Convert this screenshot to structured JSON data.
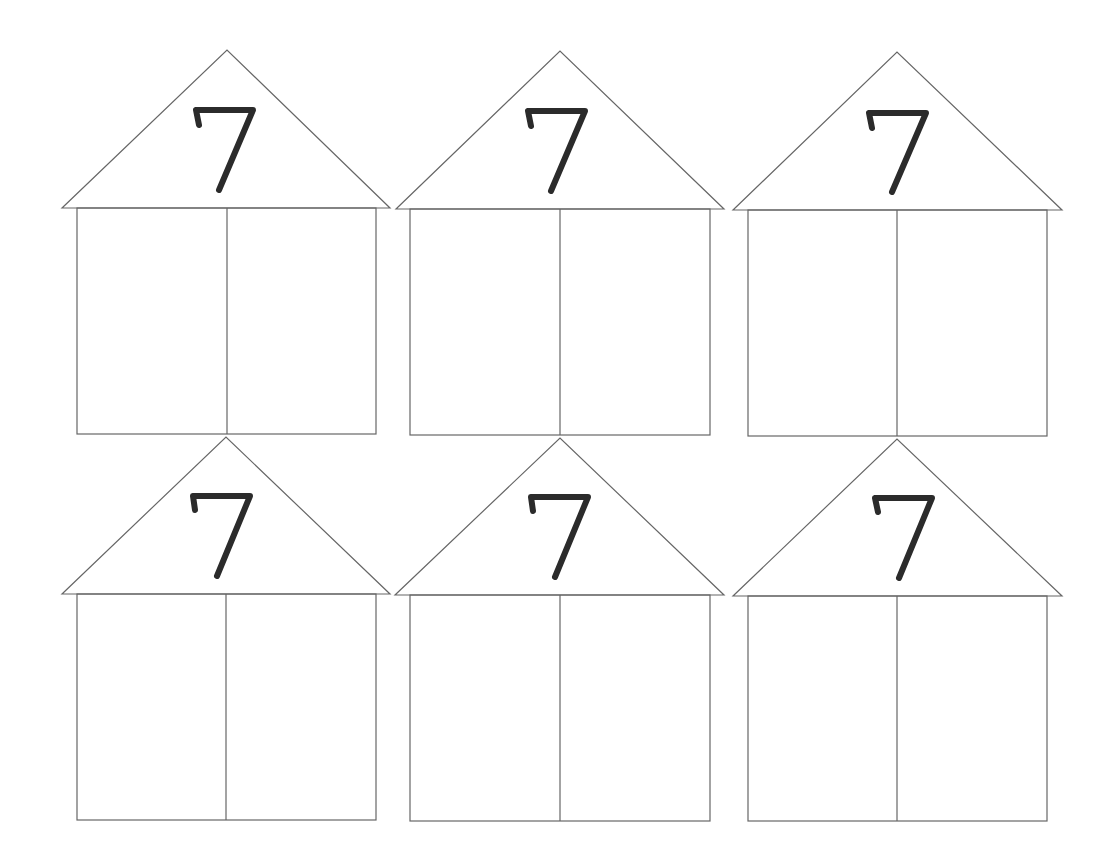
{
  "worksheet": {
    "houses": [
      {
        "number": "7",
        "left": "",
        "right": ""
      },
      {
        "number": "7",
        "left": "",
        "right": ""
      },
      {
        "number": "7",
        "left": "",
        "right": ""
      },
      {
        "number": "7",
        "left": "",
        "right": ""
      },
      {
        "number": "7",
        "left": "",
        "right": ""
      },
      {
        "number": "7",
        "left": "",
        "right": ""
      }
    ],
    "colors": {
      "line": "#555555",
      "digit": "#2b2b2b",
      "background": "#ffffff"
    }
  }
}
